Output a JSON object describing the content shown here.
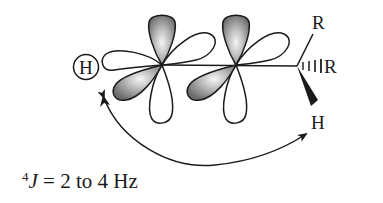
{
  "diagram": {
    "colors": {
      "line": "#1a1a1a",
      "lobe_shaded": "#8c8c8c",
      "lobe_highlight": "#f4f4f4",
      "background": "#ffffff"
    },
    "atoms": {
      "circled_h": "H",
      "top_r": "R",
      "hashed_r": "R",
      "wedge_h": "H"
    },
    "caption": {
      "superscript": "4",
      "symbol": "J",
      "text": " = 2 to 4 Hz"
    },
    "orbitals": [
      {
        "name": "p-orbital-1",
        "center": [
          162,
          65
        ]
      },
      {
        "name": "p-orbital-2",
        "center": [
          236,
          65
        ]
      }
    ],
    "arrow": {
      "type": "double-headed curved arrow",
      "from": "circled H",
      "to": "wedge H"
    }
  }
}
